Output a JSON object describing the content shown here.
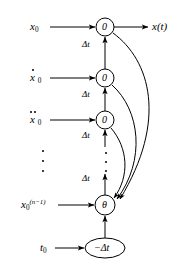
{
  "diagram": {
    "type": "signal-flow-graph",
    "stroke_color": "#000000",
    "background_color": "#ffffff",
    "nodes": [
      {
        "id": "n0",
        "label": "0",
        "shape": "circle",
        "cx": 105,
        "cy": 27,
        "r": 9
      },
      {
        "id": "n1",
        "label": "0",
        "shape": "circle",
        "cx": 105,
        "cy": 78,
        "r": 9
      },
      {
        "id": "n2",
        "label": "0",
        "shape": "circle",
        "cx": 105,
        "cy": 120,
        "r": 9
      },
      {
        "id": "theta",
        "label": "θ",
        "shape": "circle",
        "cx": 105,
        "cy": 205,
        "r": 10
      },
      {
        "id": "mdt",
        "label": "−Δt",
        "shape": "ellipse",
        "cx": 105,
        "cy": 248,
        "rx": 20,
        "ry": 10
      }
    ],
    "inputs": [
      {
        "id": "in0",
        "label_base": "x",
        "subscript": "0",
        "dots": 0,
        "superscript": "",
        "x": 30,
        "y": 21
      },
      {
        "id": "in1",
        "label_base": "x",
        "subscript": "0",
        "dots": 1,
        "superscript": "",
        "x": 30,
        "y": 72
      },
      {
        "id": "in2",
        "label_base": "x",
        "subscript": "0",
        "dots": 2,
        "superscript": "",
        "x": 30,
        "y": 114
      },
      {
        "id": "in3",
        "label_base": "x",
        "subscript": "0",
        "dots": 0,
        "superscript": "(n−1)",
        "x": 21,
        "y": 199
      },
      {
        "id": "in4",
        "label_base": "t",
        "subscript": "0",
        "dots": 0,
        "superscript": "",
        "x": 40,
        "y": 242
      }
    ],
    "output": {
      "id": "out0",
      "label": "x(t)",
      "x": 152,
      "y": 21
    },
    "edge_labels": [
      {
        "id": "dt1",
        "text": "Δt",
        "x": 82,
        "y": 47
      },
      {
        "id": "dt2",
        "text": "Δt",
        "x": 82,
        "y": 96
      },
      {
        "id": "dt3",
        "text": "Δt",
        "x": 82,
        "y": 136
      },
      {
        "id": "dt4",
        "text": "Δt",
        "x": 82,
        "y": 178
      }
    ],
    "ellipsis": [
      {
        "id": "left-vdots",
        "x": 42,
        "y": 150,
        "height": 22,
        "count": 3
      },
      {
        "id": "chain-vdots",
        "x": 105,
        "y": 152,
        "height": 20,
        "count": 3
      }
    ],
    "feedback_edges": [
      {
        "id": "fb-n0-theta",
        "from": "n0",
        "to": "theta"
      },
      {
        "id": "fb-n1-theta",
        "from": "n1",
        "to": "theta"
      },
      {
        "id": "fb-n2-theta",
        "from": "n2",
        "to": "theta"
      }
    ],
    "forward_edges": [
      {
        "id": "e-mdt-theta",
        "from": "mdt",
        "to": "theta"
      },
      {
        "id": "e-theta-n2",
        "from": "theta",
        "to": "n2"
      },
      {
        "id": "e-n2-n1",
        "from": "n2",
        "to": "n1"
      },
      {
        "id": "e-n1-n0",
        "from": "n1",
        "to": "n0"
      },
      {
        "id": "e-n0-out",
        "from": "n0",
        "to": "out0"
      }
    ]
  }
}
